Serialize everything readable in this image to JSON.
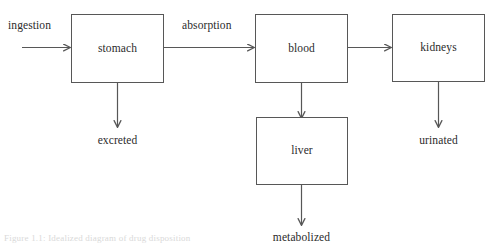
{
  "figure": {
    "caption": "Figure 1.1: Idealized diagram of drug disposition",
    "stroke_color": "#575757",
    "text_color": "#2b2b2b",
    "background_color": "#ffffff"
  },
  "nodes": [
    {
      "id": "stomach",
      "label": "stomach"
    },
    {
      "id": "blood",
      "label": "blood"
    },
    {
      "id": "kidneys",
      "label": "kidneys"
    },
    {
      "id": "liver",
      "label": "liver"
    }
  ],
  "edge_labels": [
    {
      "id": "ingestion",
      "label": "ingestion"
    },
    {
      "id": "absorption",
      "label": "absorption"
    }
  ],
  "terminal_labels": [
    {
      "id": "excreted",
      "label": "excreted"
    },
    {
      "id": "urinated",
      "label": "urinated"
    },
    {
      "id": "metabolized",
      "label": "metabolized"
    }
  ]
}
